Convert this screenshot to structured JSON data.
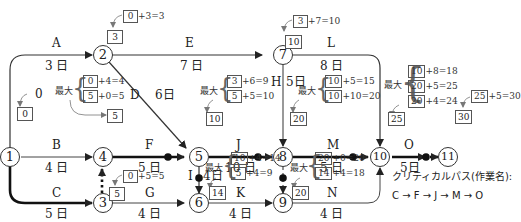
{
  "nodes": [
    {
      "id": "1",
      "label": "1"
    },
    {
      "id": "2",
      "label": "2"
    },
    {
      "id": "3",
      "label": "3"
    },
    {
      "id": "4",
      "label": "4"
    },
    {
      "id": "5",
      "label": "5"
    },
    {
      "id": "6",
      "label": "6"
    },
    {
      "id": "7",
      "label": "7"
    },
    {
      "id": "8",
      "label": "8"
    },
    {
      "id": "9",
      "label": "9"
    },
    {
      "id": "10",
      "label": "10"
    },
    {
      "id": "11",
      "label": "11"
    }
  ],
  "activities": {
    "A": {
      "name": "A",
      "duration": "3 日",
      "from": "1",
      "to": "2"
    },
    "B": {
      "name": "B",
      "duration": "4 日",
      "from": "1",
      "to": "4"
    },
    "C": {
      "name": "C",
      "duration": "5 日",
      "from": "1",
      "to": "3"
    },
    "D": {
      "name": "D",
      "duration": "6日",
      "from": "2",
      "to": "5"
    },
    "E": {
      "name": "E",
      "duration": "7 日",
      "from": "2",
      "to": "7"
    },
    "F": {
      "name": "F",
      "duration": "5 日",
      "from": "4",
      "to": "5"
    },
    "G": {
      "name": "G",
      "duration": "4 日",
      "from": "3",
      "to": "6"
    },
    "H": {
      "name": "H",
      "duration": "5日",
      "from": "7",
      "to": "8"
    },
    "I": {
      "name": "I",
      "duration": "4日",
      "from": "5",
      "to": "6"
    },
    "J": {
      "name": "J",
      "duration": "10 日",
      "from": "5",
      "to": "8"
    },
    "K": {
      "name": "K",
      "duration": "4 日",
      "from": "6",
      "to": "9"
    },
    "L": {
      "name": "L",
      "duration": "8 日",
      "from": "7",
      "to": "10"
    },
    "M": {
      "name": "M",
      "duration": "5 日",
      "from": "8",
      "to": "10"
    },
    "N": {
      "name": "N",
      "duration": "4 日",
      "from": "9",
      "to": "10"
    },
    "O": {
      "name": "O",
      "duration": "5日",
      "from": "10",
      "to": "11"
    }
  },
  "earliest": {
    "n1": {
      "start_label": "0",
      "value": "0"
    },
    "n2": {
      "calc": [
        "0",
        "+3=3"
      ],
      "value": "3"
    },
    "n3": {
      "calc": [
        "0",
        "+5=5"
      ],
      "value": "5"
    },
    "n4": {
      "max_label": "最大",
      "calc": [
        [
          "0",
          "+4=4"
        ],
        [
          "5",
          "+0=5"
        ]
      ],
      "value": "5"
    },
    "n5": {
      "max_label": "最大",
      "calc": [
        [
          "3",
          "+6=9"
        ],
        [
          "5",
          "+5=10"
        ]
      ],
      "value": "10"
    },
    "n6": {
      "max_label": "最大",
      "calc": [
        [
          "10",
          "+4=14"
        ],
        [
          "5",
          "+4=9"
        ]
      ],
      "value": "14"
    },
    "n7": {
      "calc": [
        "3",
        "+7=10"
      ],
      "value": "10"
    },
    "n8": {
      "max_label": "最大",
      "calc": [
        [
          "10",
          "+5=15"
        ],
        [
          "10",
          "+10=20"
        ]
      ],
      "value": "20"
    },
    "n9": {
      "max_label": "最大",
      "calc": [
        [
          "20",
          "+0=20"
        ],
        [
          "14",
          "+4=18"
        ]
      ],
      "value": "20"
    },
    "n10": {
      "max_label": "最大",
      "calc": [
        [
          "10",
          "+8=18"
        ],
        [
          "20",
          "+5=25"
        ],
        [
          "20",
          "+4=24"
        ]
      ],
      "value": "25"
    },
    "n11": {
      "calc": [
        "25",
        "+5=30"
      ],
      "value": "30"
    }
  },
  "critical_path": {
    "title": "クリティカルパス(作業名):",
    "path": "C → F → J → M → O",
    "sequence": [
      "C",
      "F",
      "J",
      "M",
      "O"
    ]
  },
  "colors": {
    "line": "#333333",
    "critical": "#111111",
    "dummy": "#555555",
    "box_border": "#555555"
  }
}
